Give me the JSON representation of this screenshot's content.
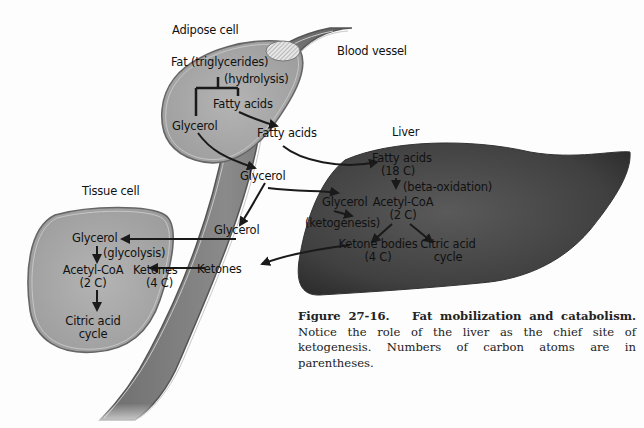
{
  "figure": {
    "labels": {
      "adipose_cell": "Adipose cell",
      "blood_vessel": "Blood vessel",
      "liver": "Liver",
      "tissue_cell": "Tissue cell"
    },
    "adipose": {
      "fat": "Fat (triglycerides)",
      "hydrolysis": "(hydrolysis)",
      "fatty_acids": "Fatty acids",
      "glycerol": "Glycerol"
    },
    "vessel": {
      "fatty_acids": "Fatty acids",
      "glycerol_upper": "Glycerol",
      "glycerol_lower": "Glycerol",
      "ketones": "Ketones"
    },
    "liver": {
      "fatty_acids": "Fatty acids",
      "fatty_acids_carbons": "(18 C)",
      "beta_oxidation": "(beta-oxidation)",
      "glycerol": "Glycerol",
      "acetyl_coa": "Acetyl-CoA",
      "acetyl_coa_carbons": "(2 C)",
      "ketogenesis": "(ketogenesis)",
      "ketone_bodies": "Ketone bodies",
      "ketone_bodies_carbons": "(4 C)",
      "citric_acid": "Citric acid",
      "cycle": "cycle"
    },
    "tissue": {
      "glycerol": "Glycerol",
      "glycolysis": "(glycolysis)",
      "acetyl_coa": "Acetyl-CoA",
      "acetyl_coa_carbons": "(2 C)",
      "ketones": "Ketones",
      "ketones_carbons": "(4 C)",
      "citric_acid": "Citric acid",
      "cycle": "cycle"
    },
    "caption": {
      "number": "Figure 27-16.",
      "title": "Fat mobilization and catabolism.",
      "body": "Notice the role of the liver as the chief site of ketogenesis. Numbers of carbon atoms are in parentheses."
    },
    "colors": {
      "cell_fill": "#a9a9a9",
      "vessel_fill": "#7d7d7d",
      "liver_fill": "#4a4a4a",
      "arrow": "#1a1a1a"
    }
  }
}
